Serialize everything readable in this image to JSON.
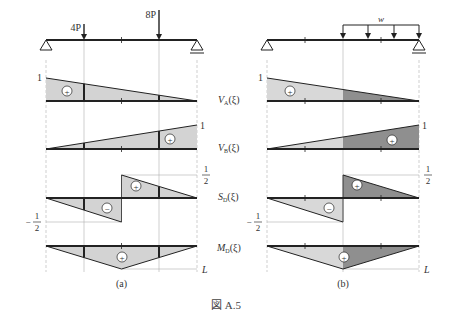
{
  "figure": {
    "caption": "図 A.5",
    "panels": [
      {
        "id": "a",
        "label": "(a)",
        "loads": [
          {
            "type": "point",
            "label": "4P",
            "position_fraction": 0.25
          },
          {
            "type": "point",
            "label": "8P",
            "position_fraction": 0.75
          }
        ],
        "supports": [
          "pin-left",
          "roller-right"
        ]
      },
      {
        "id": "b",
        "label": "(b)",
        "loads": [
          {
            "type": "distributed",
            "label": "w",
            "from_fraction": 0.5,
            "to_fraction": 1.0
          }
        ],
        "supports": [
          "pin-left",
          "roller-right"
        ]
      }
    ],
    "influence_lines": [
      {
        "name": "V_A(ξ)",
        "main": "V",
        "sub": "A",
        "arg": "(ξ)",
        "start_value": 1,
        "end_value": 0,
        "value_label": "1",
        "sign": "+"
      },
      {
        "name": "V_B(ξ)",
        "main": "V",
        "sub": "B",
        "arg": "(ξ)",
        "start_value": 0,
        "end_value": 1,
        "value_label": "1",
        "sign": "+"
      },
      {
        "name": "S_D(ξ)",
        "main": "S",
        "sub": "D",
        "arg": "(ξ)",
        "jump_at_fraction": 0.5,
        "pos_label_num": "1",
        "pos_label_den": "2",
        "neg_label": "−",
        "neg_label_num": "1",
        "neg_label_den": "2",
        "signs": [
          "−",
          "+"
        ]
      },
      {
        "name": "M_D(ξ)",
        "main": "M",
        "sub": "D",
        "arg": "(ξ)",
        "peak_at_fraction": 0.5,
        "peak_label": "L",
        "sign": "+"
      }
    ],
    "sign_symbols": {
      "plus": "+",
      "minus": "−"
    },
    "colors": {
      "fill_light": "#d3d3d3",
      "fill_dark": "#8f8f8f",
      "line": "#222222",
      "guide": "#aaaaaa"
    }
  }
}
